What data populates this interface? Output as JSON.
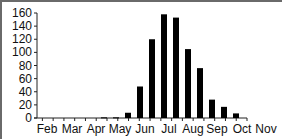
{
  "chart_data": {
    "type": "bar",
    "title": "",
    "xlabel": "",
    "ylabel": "",
    "ylim": [
      0,
      160
    ],
    "yticks": [
      0,
      20,
      40,
      60,
      80,
      100,
      120,
      140,
      160
    ],
    "xtick_labels": [
      "Feb",
      "Mar",
      "Apr",
      "May",
      "Jun",
      "Jul",
      "Aug",
      "Sep",
      "Oct",
      "Nov"
    ],
    "grid": false,
    "legend": null,
    "bar_color": "#000000",
    "categories": [
      "Feb-1",
      "Feb-2",
      "Mar-1",
      "Mar-2",
      "Apr-1",
      "Apr-2",
      "May-1",
      "May-2",
      "Jun-1",
      "Jun-2",
      "Jul-1",
      "Jul-2",
      "Aug-1",
      "Aug-2",
      "Sep-1",
      "Sep-2",
      "Oct-1",
      "Oct-2",
      "Nov-1"
    ],
    "values": [
      0,
      0,
      0,
      0,
      1,
      1,
      8,
      48,
      120,
      158,
      153,
      105,
      76,
      28,
      17,
      7,
      0,
      0,
      0
    ]
  }
}
